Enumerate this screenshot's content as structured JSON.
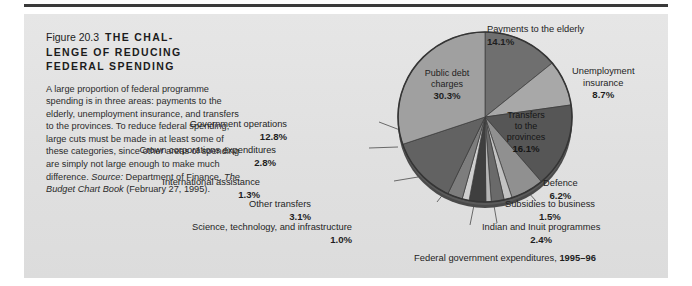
{
  "figure": {
    "number": "Figure 20.3",
    "title_line1_num": "Figure 20.3",
    "title_line1_hdr": "THE CHAL-",
    "title_line2": "LENGE OF REDUCING",
    "title_line3": "FEDERAL SPENDING",
    "body_text": "A large proportion of federal programme spending is in three areas: payments to the elderly, unemployment insurance, and transfers to the provinces. To reduce federal spending, large cuts must be made in at least some of these categories, since other areas of spending are simply not large enough to make much difference. ",
    "source_label": "Source:",
    "source_text": " Department of Finance, ",
    "source_title": "The Budget Chart Book",
    "source_date": " (February 27, 1995).",
    "footer": "Federal government expenditures, ",
    "footer_year": "1995–96"
  },
  "chart_data": {
    "type": "pie",
    "title": "Federal government expenditures, 1995–96",
    "unit": "percent",
    "legend": "none",
    "categories": [
      "Payments to the elderly",
      "Unemployment insurance",
      "Transfers to the provinces",
      "Defence",
      "Subsidies to business",
      "Indian and Inuit programmes",
      "Science, technology, and infrastructure",
      "Other transfers",
      "International assistance",
      "Crown corporations expenditures",
      "Government operations",
      "Public debt charges"
    ],
    "values": [
      14.1,
      8.7,
      16.1,
      6.2,
      1.5,
      2.4,
      1.0,
      3.1,
      1.3,
      2.8,
      12.8,
      30.3
    ],
    "slices": [
      {
        "label": "Payments to the elderly",
        "value": 14.1,
        "pct": "14.1%",
        "color": "#6f6f6f"
      },
      {
        "label": "Unemployment insurance",
        "value": 8.7,
        "pct": "8.7%",
        "color": "#a8a8a8"
      },
      {
        "label": "Transfers to the provinces",
        "value": 16.1,
        "pct": "16.1%",
        "color": "#565656"
      },
      {
        "label": "Defence",
        "value": 6.2,
        "pct": "6.2%",
        "color": "#909090"
      },
      {
        "label": "Subsidies to business",
        "value": 1.5,
        "pct": "1.5%",
        "color": "#c2c2c2"
      },
      {
        "label": "Indian and Inuit programmes",
        "value": 2.4,
        "pct": "2.4%",
        "color": "#6a6a6a"
      },
      {
        "label": "Science, technology, and infrastructure",
        "value": 1.0,
        "pct": "1.0%",
        "color": "#b5b5b5"
      },
      {
        "label": "Other transfers",
        "value": 3.1,
        "pct": "3.1%",
        "color": "#3f3f3f"
      },
      {
        "label": "International assistance",
        "value": 1.3,
        "pct": "1.3%",
        "color": "#cfcfcf"
      },
      {
        "label": "Crown corporations expenditures",
        "value": 2.8,
        "pct": "2.8%",
        "color": "#7d7d7d"
      },
      {
        "label": "Government operations",
        "value": 12.8,
        "pct": "12.8%",
        "color": "#626262"
      },
      {
        "label": "Public debt charges",
        "value": 30.3,
        "pct": "30.3%",
        "color": "#a0a0a0"
      }
    ]
  },
  "labels": {
    "public_debt": {
      "line1": "Public debt",
      "line2": "charges",
      "pct": "30.3%"
    },
    "transfers": {
      "line1": "Transfers",
      "line2": "to the",
      "line3": "provinces",
      "pct": "16.1%"
    },
    "elderly": {
      "name": "Payments to the elderly",
      "pct": "14.1%"
    },
    "ei": {
      "line1": "Unemployment",
      "line2": "insurance",
      "pct": "8.7%"
    },
    "defence": {
      "name": "Defence",
      "pct": "6.2%"
    },
    "subsidies": {
      "name": "Subsidies to business",
      "pct": "1.5%"
    },
    "indian": {
      "name": "Indian and Inuit programmes",
      "pct": "2.4%"
    },
    "govops": {
      "name": "Government operations",
      "pct": "12.8%"
    },
    "crown": {
      "name": "Crown corporations expenditures",
      "pct": "2.8%"
    },
    "intassist": {
      "name": "International assistance",
      "pct": "1.3%"
    },
    "othertrans": {
      "name": "Other transfers",
      "pct": "3.1%"
    },
    "science": {
      "name": "Science, technology, and infrastructure",
      "pct": "1.0%"
    }
  },
  "colors": {
    "panel_bg": "#e2e2e2",
    "page_bg": "#ffffff",
    "rule": "#3a3a3a",
    "text": "#1e1e1e",
    "pie_edge": "#3c3c3c"
  }
}
